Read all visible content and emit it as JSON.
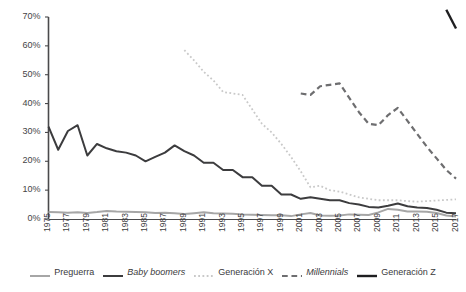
{
  "chart_data": {
    "type": "line",
    "title": "",
    "xlabel": "",
    "ylabel": "",
    "ylim": [
      0,
      70
    ],
    "ytick_values": [
      0,
      10,
      20,
      30,
      40,
      50,
      60,
      70
    ],
    "ytick_labels": [
      "0%",
      "10%",
      "20%",
      "30%",
      "40%",
      "50%",
      "60%",
      "70%"
    ],
    "grid": false,
    "legend_position": "bottom",
    "x": [
      1975,
      1976,
      1977,
      1978,
      1979,
      1980,
      1981,
      1982,
      1983,
      1984,
      1985,
      1986,
      1987,
      1988,
      1989,
      1990,
      1991,
      1992,
      1993,
      1994,
      1995,
      1996,
      1997,
      1998,
      1999,
      2000,
      2001,
      2002,
      2003,
      2004,
      2005,
      2006,
      2007,
      2008,
      2009,
      2010,
      2011,
      2012,
      2013,
      2014,
      2015,
      2016,
      2017
    ],
    "xtick_labels": [
      "1975",
      "1977",
      "1979",
      "1981",
      "1983",
      "1985",
      "1987",
      "1989",
      "1991",
      "1993",
      "1995",
      "1997",
      "1999",
      "2001",
      "2003",
      "2005",
      "2007",
      "2009",
      "2011",
      "2013",
      "2015",
      "2017"
    ],
    "series": [
      {
        "name": "Preguerra",
        "style": "solid",
        "color": "#a6a6a6",
        "width": 2.0,
        "values": [
          2.4,
          2.3,
          2.2,
          2.3,
          2.1,
          2.4,
          2.8,
          2.6,
          2.5,
          2.4,
          2.3,
          2.1,
          2.2,
          2.0,
          1.7,
          2.0,
          2.3,
          2.0,
          1.9,
          1.8,
          1.6,
          1.5,
          1.4,
          1.3,
          1.3,
          1.0,
          1.6,
          2.1,
          1.2,
          1.1,
          1.2,
          1.6,
          1.5,
          1.4,
          2.3,
          3.5,
          3.2,
          2.6,
          2.6,
          2.5,
          2.1,
          1.2,
          0.9
        ]
      },
      {
        "name": "Baby boomers",
        "style": "solid",
        "color": "#3c3c3e",
        "width": 2.0,
        "italic_legend": true,
        "values": [
          32.0,
          24.0,
          30.5,
          32.5,
          22.0,
          26.0,
          24.5,
          23.5,
          23.0,
          22.0,
          20.0,
          21.5,
          23.0,
          25.5,
          23.5,
          22.0,
          19.5,
          19.5,
          17.0,
          17.0,
          14.5,
          14.5,
          11.5,
          11.5,
          8.5,
          8.5,
          7.0,
          7.5,
          7.0,
          6.5,
          6.5,
          5.5,
          5.0,
          4.2,
          4.0,
          4.6,
          5.4,
          4.4,
          4.0,
          3.8,
          3.2,
          2.2,
          2.0
        ]
      },
      {
        "name": "Generación X",
        "style": "dotted",
        "color": "#c9c9c9",
        "width": 1.8,
        "values": [
          null,
          null,
          null,
          null,
          null,
          null,
          null,
          null,
          null,
          null,
          null,
          null,
          null,
          null,
          58.5,
          55.0,
          51.0,
          48.0,
          44.0,
          43.5,
          43.0,
          38.0,
          33.0,
          30.0,
          26.0,
          21.5,
          16.5,
          11.0,
          11.5,
          10.0,
          9.5,
          8.5,
          7.5,
          7.0,
          6.5,
          6.5,
          6.5,
          6.2,
          6.0,
          6.2,
          6.4,
          6.6,
          6.8
        ]
      },
      {
        "name": "Millennials",
        "style": "dashed",
        "color": "#6e6e70",
        "width": 2.2,
        "italic_legend": true,
        "values": [
          null,
          null,
          null,
          null,
          null,
          null,
          null,
          null,
          null,
          null,
          null,
          null,
          null,
          null,
          null,
          null,
          null,
          null,
          null,
          null,
          null,
          null,
          null,
          null,
          null,
          null,
          43.5,
          43.0,
          46.0,
          46.5,
          47.0,
          42.0,
          37.0,
          33.0,
          32.5,
          36.0,
          38.5,
          34.0,
          29.5,
          25.0,
          21.0,
          17.0,
          14.0
        ]
      },
      {
        "name": "Generación Z",
        "style": "solid",
        "color": "#1f1f21",
        "width": 2.4,
        "values": [
          null,
          null,
          null,
          null,
          null,
          null,
          null,
          null,
          null,
          null,
          null,
          null,
          null,
          null,
          null,
          null,
          null,
          null,
          null,
          null,
          null,
          null,
          null,
          null,
          null,
          null,
          null,
          null,
          null,
          null,
          null,
          null,
          null,
          null,
          null,
          null,
          null,
          null,
          null,
          null,
          null,
          72.5,
          66.0
        ]
      }
    ]
  },
  "legend": {
    "items": [
      {
        "label": "Preguerra",
        "swatch": "solid-light-gray"
      },
      {
        "label": "Baby boomers",
        "swatch": "solid-dark-gray"
      },
      {
        "label": "Generación X",
        "swatch": "dotted-light-gray"
      },
      {
        "label": "Millennials",
        "swatch": "dashed-medium-gray"
      },
      {
        "label": "Generación Z",
        "swatch": "solid-black"
      }
    ]
  }
}
